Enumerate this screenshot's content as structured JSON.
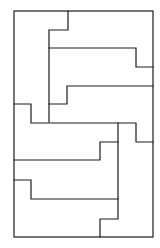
{
  "diagram": {
    "stroke_color": "#1c1c1c",
    "background": "#ffffff",
    "outer": {
      "x": 14,
      "y": 11,
      "width": 139,
      "height": 226
    },
    "segments": [
      {
        "id": "top-step",
        "points": "68,11 68,30 49,30 49,122"
      },
      {
        "id": "upper-band",
        "points": "49,48 136,48 136,67 153,67"
      },
      {
        "id": "mid-step",
        "points": "49,104 67,104 67,86 153,86"
      },
      {
        "id": "center-divider",
        "points": "14,104 31,104 31,123 136,123 136,142 153,142"
      },
      {
        "id": "right-column",
        "points": "118,123 118,219 100,219 100,237"
      },
      {
        "id": "lower-step",
        "points": "14,160 100,160 100,142 118,142"
      },
      {
        "id": "bottom-step",
        "points": "14,180 31,180 31,199 118,199"
      }
    ]
  }
}
